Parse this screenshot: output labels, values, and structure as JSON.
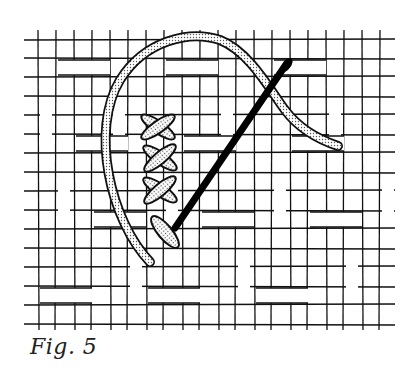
{
  "figure": {
    "caption": "Fig. 5",
    "elements": [
      "woven-canvas-grid",
      "thread-loop",
      "cross-stitches",
      "needle"
    ]
  },
  "colors": {
    "background": "#ffffff",
    "ink": "#111111",
    "thread_fill": "#dcdcdc"
  }
}
